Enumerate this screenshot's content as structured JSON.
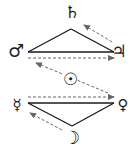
{
  "diagram": {
    "type": "planetary-relations",
    "colors": {
      "line": "#1a1a1a",
      "dashed": "#666666",
      "background": "#ffffff"
    },
    "nodes": [
      {
        "id": "saturn",
        "glyph": "♄",
        "x": 72,
        "y": 12,
        "size": 17
      },
      {
        "id": "mars",
        "glyph": "♂",
        "x": 16,
        "y": 51,
        "size": 18
      },
      {
        "id": "jupiter",
        "glyph": "♃",
        "x": 119,
        "y": 51,
        "size": 17
      },
      {
        "id": "sun",
        "glyph": "☉",
        "x": 70,
        "y": 79,
        "size": 17
      },
      {
        "id": "mercury",
        "glyph": "☿",
        "x": 17,
        "y": 105,
        "size": 15
      },
      {
        "id": "venus",
        "glyph": "♀",
        "x": 123,
        "y": 105,
        "size": 15
      },
      {
        "id": "moon",
        "glyph": "☽",
        "x": 72,
        "y": 138,
        "size": 18
      }
    ],
    "solid_edges": [
      {
        "from": "mars",
        "to": "saturn"
      },
      {
        "from": "saturn",
        "to": "jupiter"
      },
      {
        "from": "mars",
        "to": "jupiter"
      },
      {
        "from": "mercury",
        "to": "venus"
      },
      {
        "from": "mercury",
        "to": "moon"
      },
      {
        "from": "moon",
        "to": "venus"
      }
    ],
    "dashed_arrows": [
      {
        "from": "jupiter",
        "to": "saturn"
      },
      {
        "from": "mars",
        "to": "jupiter"
      },
      {
        "from": "venus",
        "to": "mars",
        "via": "sun"
      },
      {
        "from": "mercury",
        "to": "venus"
      },
      {
        "from": "moon",
        "to": "mercury"
      }
    ]
  }
}
